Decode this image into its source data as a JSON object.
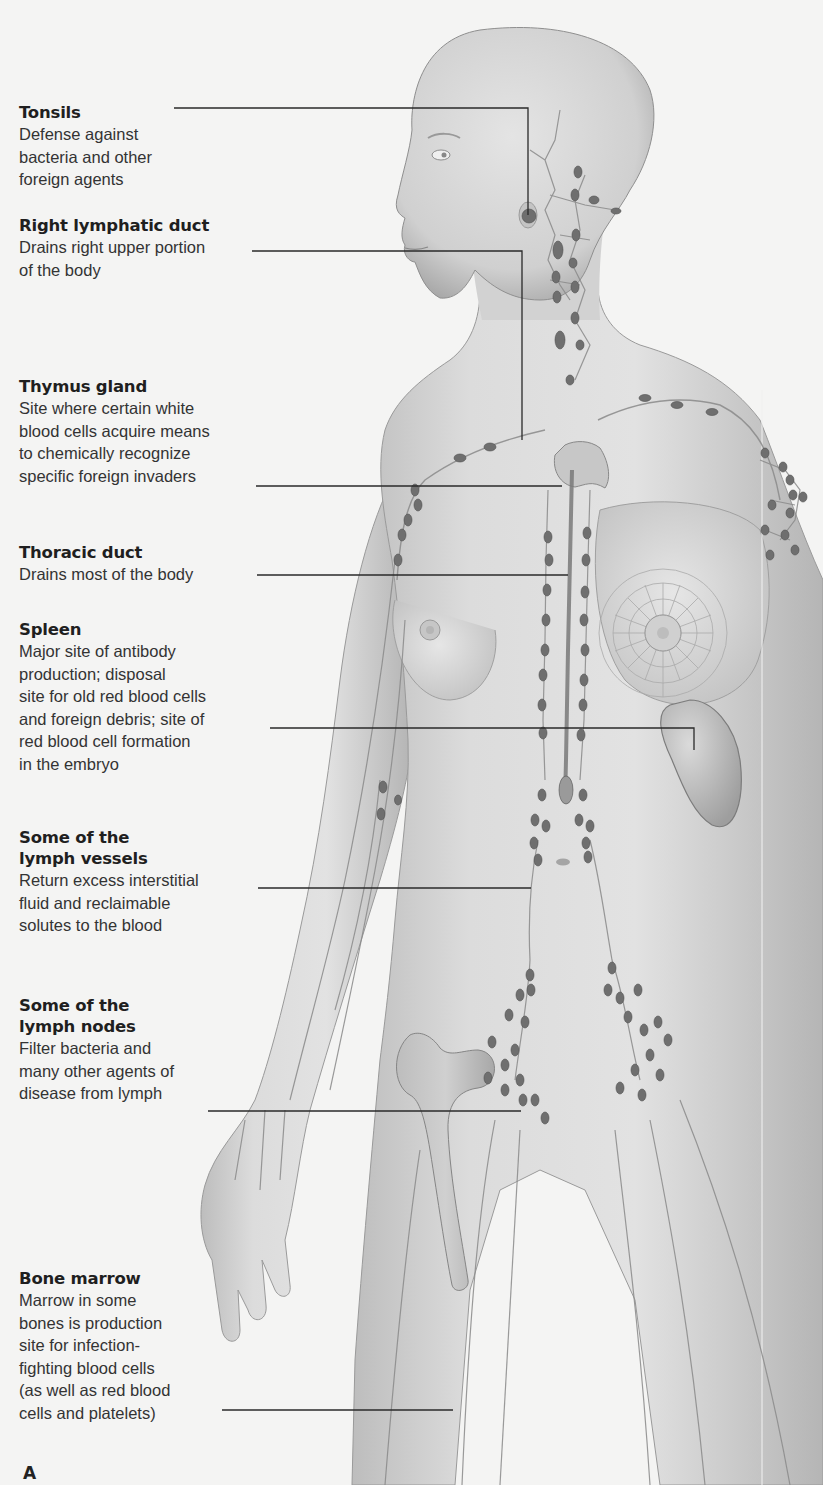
{
  "figure": {
    "panel_letter": "A",
    "background_color": "#f4f4f3",
    "skin_color": "#d6d6d6",
    "node_color": "#6e6e6e",
    "leader_line_color": "#2a2a2a"
  },
  "labels": [
    {
      "id": "tonsils",
      "title": "Tonsils",
      "description": "Defense against\nbacteria and other\nforeign agents"
    },
    {
      "id": "right-lymphatic-duct",
      "title": "Right lymphatic duct",
      "description": "Drains right upper portion\nof the body"
    },
    {
      "id": "thymus-gland",
      "title": "Thymus gland",
      "description": "Site where certain white\nblood cells acquire means\nto chemically recognize\nspecific foreign invaders"
    },
    {
      "id": "thoracic-duct",
      "title": "Thoracic duct",
      "description": "Drains most of the body"
    },
    {
      "id": "spleen",
      "title": "Spleen",
      "description": "Major site of antibody\nproduction; disposal\nsite for old red blood cells\nand foreign debris; site of\nred blood cell formation\nin the embryo"
    },
    {
      "id": "lymph-vessels",
      "title": "Some of the\nlymph vessels",
      "description": "Return excess interstitial\nfluid and reclaimable\nsolutes to the blood"
    },
    {
      "id": "lymph-nodes",
      "title": "Some of the\nlymph nodes",
      "description": "Filter bacteria and\nmany other agents of\ndisease from lymph"
    },
    {
      "id": "bone-marrow",
      "title": "Bone marrow",
      "description": "Marrow in some\nbones is production\nsite for infection-\nfighting blood cells\n(as well as red blood\ncells and platelets)"
    }
  ]
}
